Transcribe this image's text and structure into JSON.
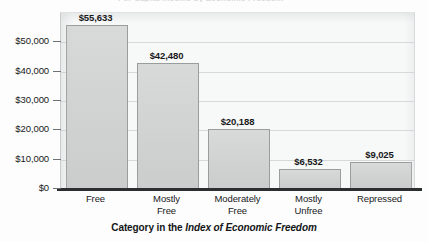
{
  "chart_data": {
    "type": "bar",
    "title": "",
    "xlabel_prefix": "Category in the ",
    "xlabel_italic": "Index of Economic Freedom",
    "ylabel": "",
    "categories": [
      "Free",
      "Mostly Free",
      "Moderately Free",
      "Mostly Unfree",
      "Repressed"
    ],
    "category_lines": [
      [
        "Free"
      ],
      [
        "Mostly",
        "Free"
      ],
      [
        "Moderately",
        "Free"
      ],
      [
        "Mostly",
        "Unfree"
      ],
      [
        "Repressed"
      ]
    ],
    "values": [
      55633,
      42480,
      20188,
      6532,
      9025
    ],
    "value_labels": [
      "$55,633",
      "$42,480",
      "$20,188",
      "$6,532",
      "$9,025"
    ],
    "ytick_values": [
      0,
      10000,
      20000,
      30000,
      40000,
      50000
    ],
    "ytick_labels": [
      "$0",
      "$10,000",
      "$20,000",
      "$30,000",
      "$40,000",
      "$50,000"
    ],
    "ylim": [
      0,
      60000
    ],
    "grid": true,
    "legend": "none",
    "bar_fill_color": "#d3d5d4",
    "bar_edge_color": "#9a9d9e",
    "plot_background_color": "#f7f8f8",
    "gridline_color": "#d6d9da",
    "baseline_color": "#2c2f30",
    "text_color": "#17191a"
  },
  "cropped_top_title": "Per Capita Income by Economic Freedom"
}
